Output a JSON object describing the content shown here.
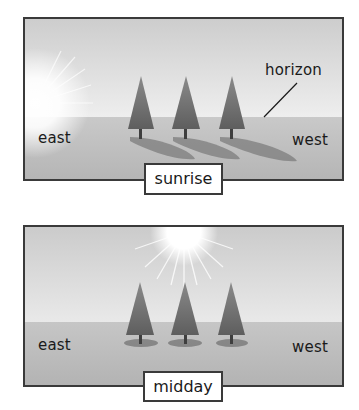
{
  "panels": [
    {
      "caption": "sunrise",
      "labels": {
        "left": "east",
        "right": "west",
        "callout": "horizon"
      },
      "sun_position": "east horizon",
      "shadows": "long, toward west"
    },
    {
      "caption": "midday",
      "labels": {
        "left": "east",
        "right": "west"
      },
      "sun_position": "overhead",
      "shadows": "short, directly under trees"
    }
  ],
  "colors": {
    "border": "#3a3a3a",
    "sky_top": "#cfcfcf",
    "sky_bottom": "#ececec",
    "ground": "#bdbdbd",
    "tree": "#6e6e6e",
    "shadow": "#7a7a7a"
  }
}
